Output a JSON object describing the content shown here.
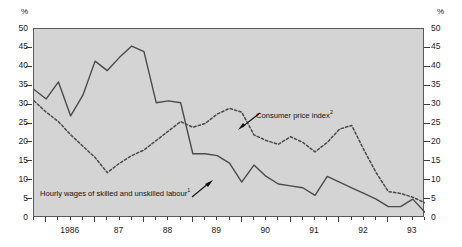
{
  "axes": {
    "unit_left": "%",
    "unit_right": "%",
    "y_ticks": [
      "0",
      "5",
      "10",
      "15",
      "20",
      "25",
      "30",
      "35",
      "40",
      "45",
      "50"
    ],
    "x_ticks": [
      "1986",
      "87",
      "88",
      "89",
      "90",
      "91",
      "92",
      "93"
    ]
  },
  "annotations": {
    "cpi": {
      "text": "Consumer price index",
      "note": "2"
    },
    "wages": {
      "text": "Hourly wages of skilled and unskilled labour",
      "note": "1"
    }
  },
  "colors": {
    "plot_background": "#d4d4d4",
    "frame": "#5a5a5a",
    "series_wages": "#4a4a4a",
    "series_cpi": "#4a4a4a",
    "text": "#1a1a1a"
  },
  "chart_data": {
    "type": "line",
    "title": "",
    "xlabel": "",
    "ylabel": "%",
    "ylim": [
      0,
      50
    ],
    "xlim": [
      1985.75,
      1993.75
    ],
    "grid": false,
    "legend": "annotated-inline",
    "x": [
      1985.75,
      1986.0,
      1986.25,
      1986.5,
      1986.75,
      1987.0,
      1987.25,
      1987.5,
      1987.75,
      1988.0,
      1988.25,
      1988.5,
      1988.75,
      1989.0,
      1989.25,
      1989.5,
      1989.75,
      1990.0,
      1990.25,
      1990.5,
      1990.75,
      1991.0,
      1991.25,
      1991.5,
      1991.75,
      1992.0,
      1992.25,
      1992.5,
      1992.75,
      1993.0,
      1993.25,
      1993.5,
      1993.75
    ],
    "series": [
      {
        "name": "Hourly wages of skilled and unskilled labour",
        "note": "1",
        "style": "solid",
        "values": [
          34.0,
          31.5,
          36.0,
          27.0,
          32.5,
          41.5,
          39.0,
          42.5,
          45.5,
          44.0,
          30.5,
          31.0,
          30.5,
          17.0,
          17.0,
          16.5,
          14.5,
          9.5,
          14.0,
          11.0,
          9.0,
          8.5,
          8.0,
          6.0,
          11.0,
          9.5,
          8.0,
          6.5,
          5.0,
          3.0,
          3.0,
          5.0,
          1.5
        ]
      },
      {
        "name": "Consumer price index",
        "note": "2",
        "style": "dashed",
        "values": [
          31.0,
          28.0,
          25.5,
          22.0,
          19.0,
          16.0,
          12.0,
          14.5,
          16.5,
          18.0,
          20.5,
          23.0,
          25.5,
          24.0,
          25.0,
          27.5,
          29.0,
          28.0,
          22.0,
          20.5,
          19.5,
          21.5,
          20.0,
          17.5,
          20.0,
          23.5,
          24.5,
          18.0,
          12.0,
          7.0,
          6.5,
          5.5,
          4.0
        ]
      }
    ]
  }
}
